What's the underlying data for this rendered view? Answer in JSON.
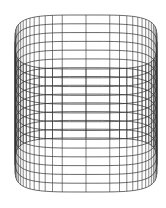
{
  "drawing": {
    "type": "wireframe",
    "subject": "rounded-square cylinder (superellipse prism) in isometric view",
    "stroke_color": "#2a2a2a",
    "background": "#ffffff",
    "geometry": {
      "center_x": 86,
      "half_width": 71,
      "half_depth_projected": 27,
      "top_y": 42,
      "bottom_y": 165,
      "superellipse_exponent": 4,
      "ring_count": 15,
      "generator_count": 56
    }
  }
}
